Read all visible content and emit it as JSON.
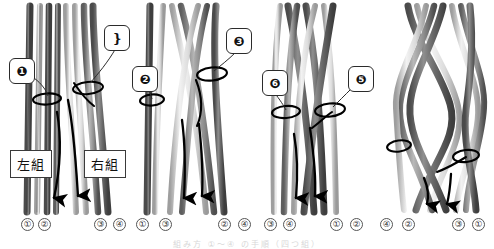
{
  "figure": {
    "title_hidden_caption": "組み方 ①～④ の手順（四つ組）",
    "colors": {
      "strand_dark": "#6f6f6f",
      "strand_darker": "#4d4d4d",
      "strand_light": "#e8e8e8",
      "strand_outline": "#2a2a2a",
      "arrow": "#000000",
      "callout_border": "#2b2b2b",
      "background": "#ffffff"
    }
  },
  "panels": [
    {
      "id": "panel-1",
      "callouts": [
        {
          "label": "❶",
          "name": "callout-2"
        },
        {
          "label": "❵",
          "name": "callout-1"
        }
      ],
      "group_labels": [
        {
          "text": "左組",
          "name": "left-group-label"
        },
        {
          "text": "右組",
          "name": "right-group-label"
        }
      ],
      "bottom_numbers": [
        "①",
        "②",
        "③",
        "④"
      ]
    },
    {
      "id": "panel-2",
      "callouts": [
        {
          "label": "❷",
          "name": "callout-4"
        },
        {
          "label": "❸",
          "name": "callout-3"
        }
      ],
      "group_labels": [],
      "bottom_numbers": [
        "①",
        "③",
        "②",
        "④"
      ]
    },
    {
      "id": "panel-3",
      "callouts": [
        {
          "label": "❻",
          "name": "callout-6"
        },
        {
          "label": "❺",
          "name": "callout-5"
        }
      ],
      "group_labels": [],
      "bottom_numbers": [
        "③",
        "④",
        "①",
        "②"
      ]
    },
    {
      "id": "panel-4",
      "callouts": [],
      "group_labels": [],
      "bottom_numbers": [
        "④",
        "②",
        "③",
        "①"
      ]
    }
  ],
  "callout_labels": {
    "one": "❶",
    "two": "❷",
    "three": "❸",
    "four": "❹",
    "five": "❺",
    "six": "❻"
  },
  "bottom_number_glyphs": {
    "n1": "①",
    "n2": "②",
    "n3": "③",
    "n4": "④"
  }
}
